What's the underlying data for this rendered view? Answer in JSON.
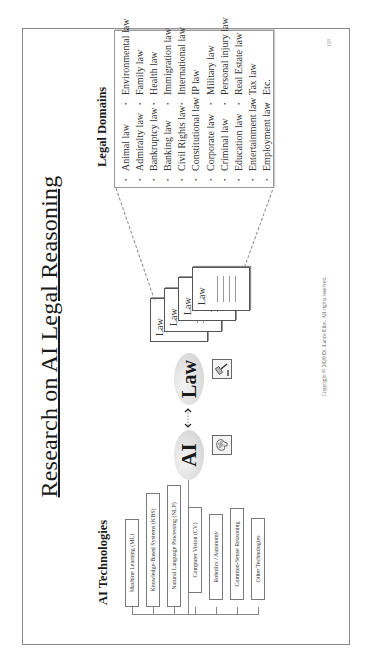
{
  "slide": {
    "title": "Research on AI Legal Reasoning",
    "page_number": "118",
    "copyright": "Copyright © 2020 Dr. Lance Eliot. All rights reserved."
  },
  "ai_technologies": {
    "heading": "AI Technologies",
    "items": [
      "Machine Learning (ML)",
      "Knowledge-Based Systems (KBS)",
      "Natural Language Processing (NLP)",
      "Computer Vision (CV)",
      "Robotics / Autonomy",
      "Common-Sense Reasoning",
      "Other Technologies"
    ]
  },
  "center": {
    "ai_label": "AI",
    "law_label": "Law",
    "ai_icon": "brain-icon",
    "law_icon": "gavel-icon",
    "connector": "double-arrow-icon"
  },
  "law_documents": {
    "label": "Law",
    "count": 4
  },
  "legal_domains": {
    "heading": "Legal Domains",
    "bullet": "•",
    "column1": [
      "Animal law",
      "Admiralty law",
      "Bankruptcy law",
      "Banking law",
      "Civil Rights law",
      "Constitutional law",
      "Corporate law",
      "Criminal law",
      "Education law",
      "Entertainment law",
      "Employment law"
    ],
    "column2": [
      "Environmental law",
      "Family law",
      "Health law",
      "Immigration law",
      "International law",
      "IP law",
      "Military law",
      "Personal injury law",
      "Real Estate law",
      "Tax law",
      "Etc."
    ]
  }
}
